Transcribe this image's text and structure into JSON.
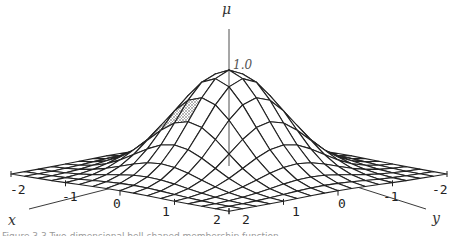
{
  "figure": {
    "caption": "Figure 3.3  Two-dimensional bell-shaped membership function",
    "z_axis_label": "μ",
    "peak_label": "1.0",
    "x_axis_label": "x",
    "y_axis_label": "y"
  },
  "chart_data": {
    "type": "surface",
    "title": "",
    "function": "mu(x,y) = exp(-(x^2 + y^2))",
    "xlabel": "x",
    "ylabel": "y",
    "zlabel": "μ",
    "x_range": [
      -2,
      2
    ],
    "y_range": [
      -2,
      2
    ],
    "z_range": [
      0,
      1.0
    ],
    "grid_steps": 16,
    "x_ticks": [
      "-2",
      "-1",
      "0",
      "1",
      "2"
    ],
    "y_ticks": [
      "2",
      "1",
      "0",
      "-1",
      "-2"
    ],
    "z_ticks": [
      "1.0"
    ],
    "peak": {
      "x": 0,
      "y": 0,
      "z": 1.0
    },
    "shaded_region": "thin hatched strip along left slope of the surface",
    "colors": {
      "line": "#222222",
      "fill": "#ffffff",
      "hatch": "#888888"
    }
  }
}
